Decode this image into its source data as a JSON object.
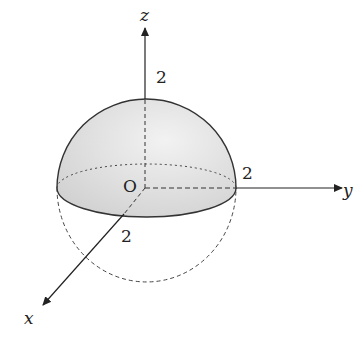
{
  "diagram": {
    "type": "hemisphere-3d-axes",
    "axes": {
      "x": {
        "label": "x"
      },
      "y": {
        "label": "y"
      },
      "z": {
        "label": "z"
      }
    },
    "origin_label": "O",
    "radius_labels": {
      "z": "2",
      "y": "2",
      "x": "2"
    },
    "colors": {
      "fill": "#d9d9d9",
      "stroke": "#333333"
    }
  }
}
